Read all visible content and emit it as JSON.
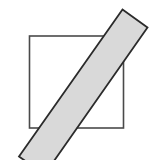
{
  "figure": {
    "canvas": {
      "width": 158,
      "height": 160,
      "background_color": "#ffffff"
    },
    "shapes": [
      {
        "name": "square",
        "type": "rect",
        "x": 29.5,
        "y": 36.0,
        "width": 94.0,
        "height": 92.0,
        "fill_color": "#ffffff",
        "stroke_color": "#4a4a4a",
        "stroke_width": 1.6,
        "rotation_deg": 0,
        "label": "Square"
      },
      {
        "name": "diagonal-band",
        "type": "polygon",
        "points": "19.0,156.5 122.5,9.5 147.5,27.5 44.5,174.5",
        "fill_color": "#d9d9d9",
        "stroke_color": "#2b2b2b",
        "stroke_width": 1.8,
        "rotation_deg": -55,
        "label": "Band"
      }
    ],
    "colors": {
      "band_fill": "#d9d9d9",
      "band_stroke": "#2b2b2b",
      "square_fill": "#ffffff",
      "square_stroke": "#4a4a4a",
      "background": "#ffffff"
    }
  }
}
